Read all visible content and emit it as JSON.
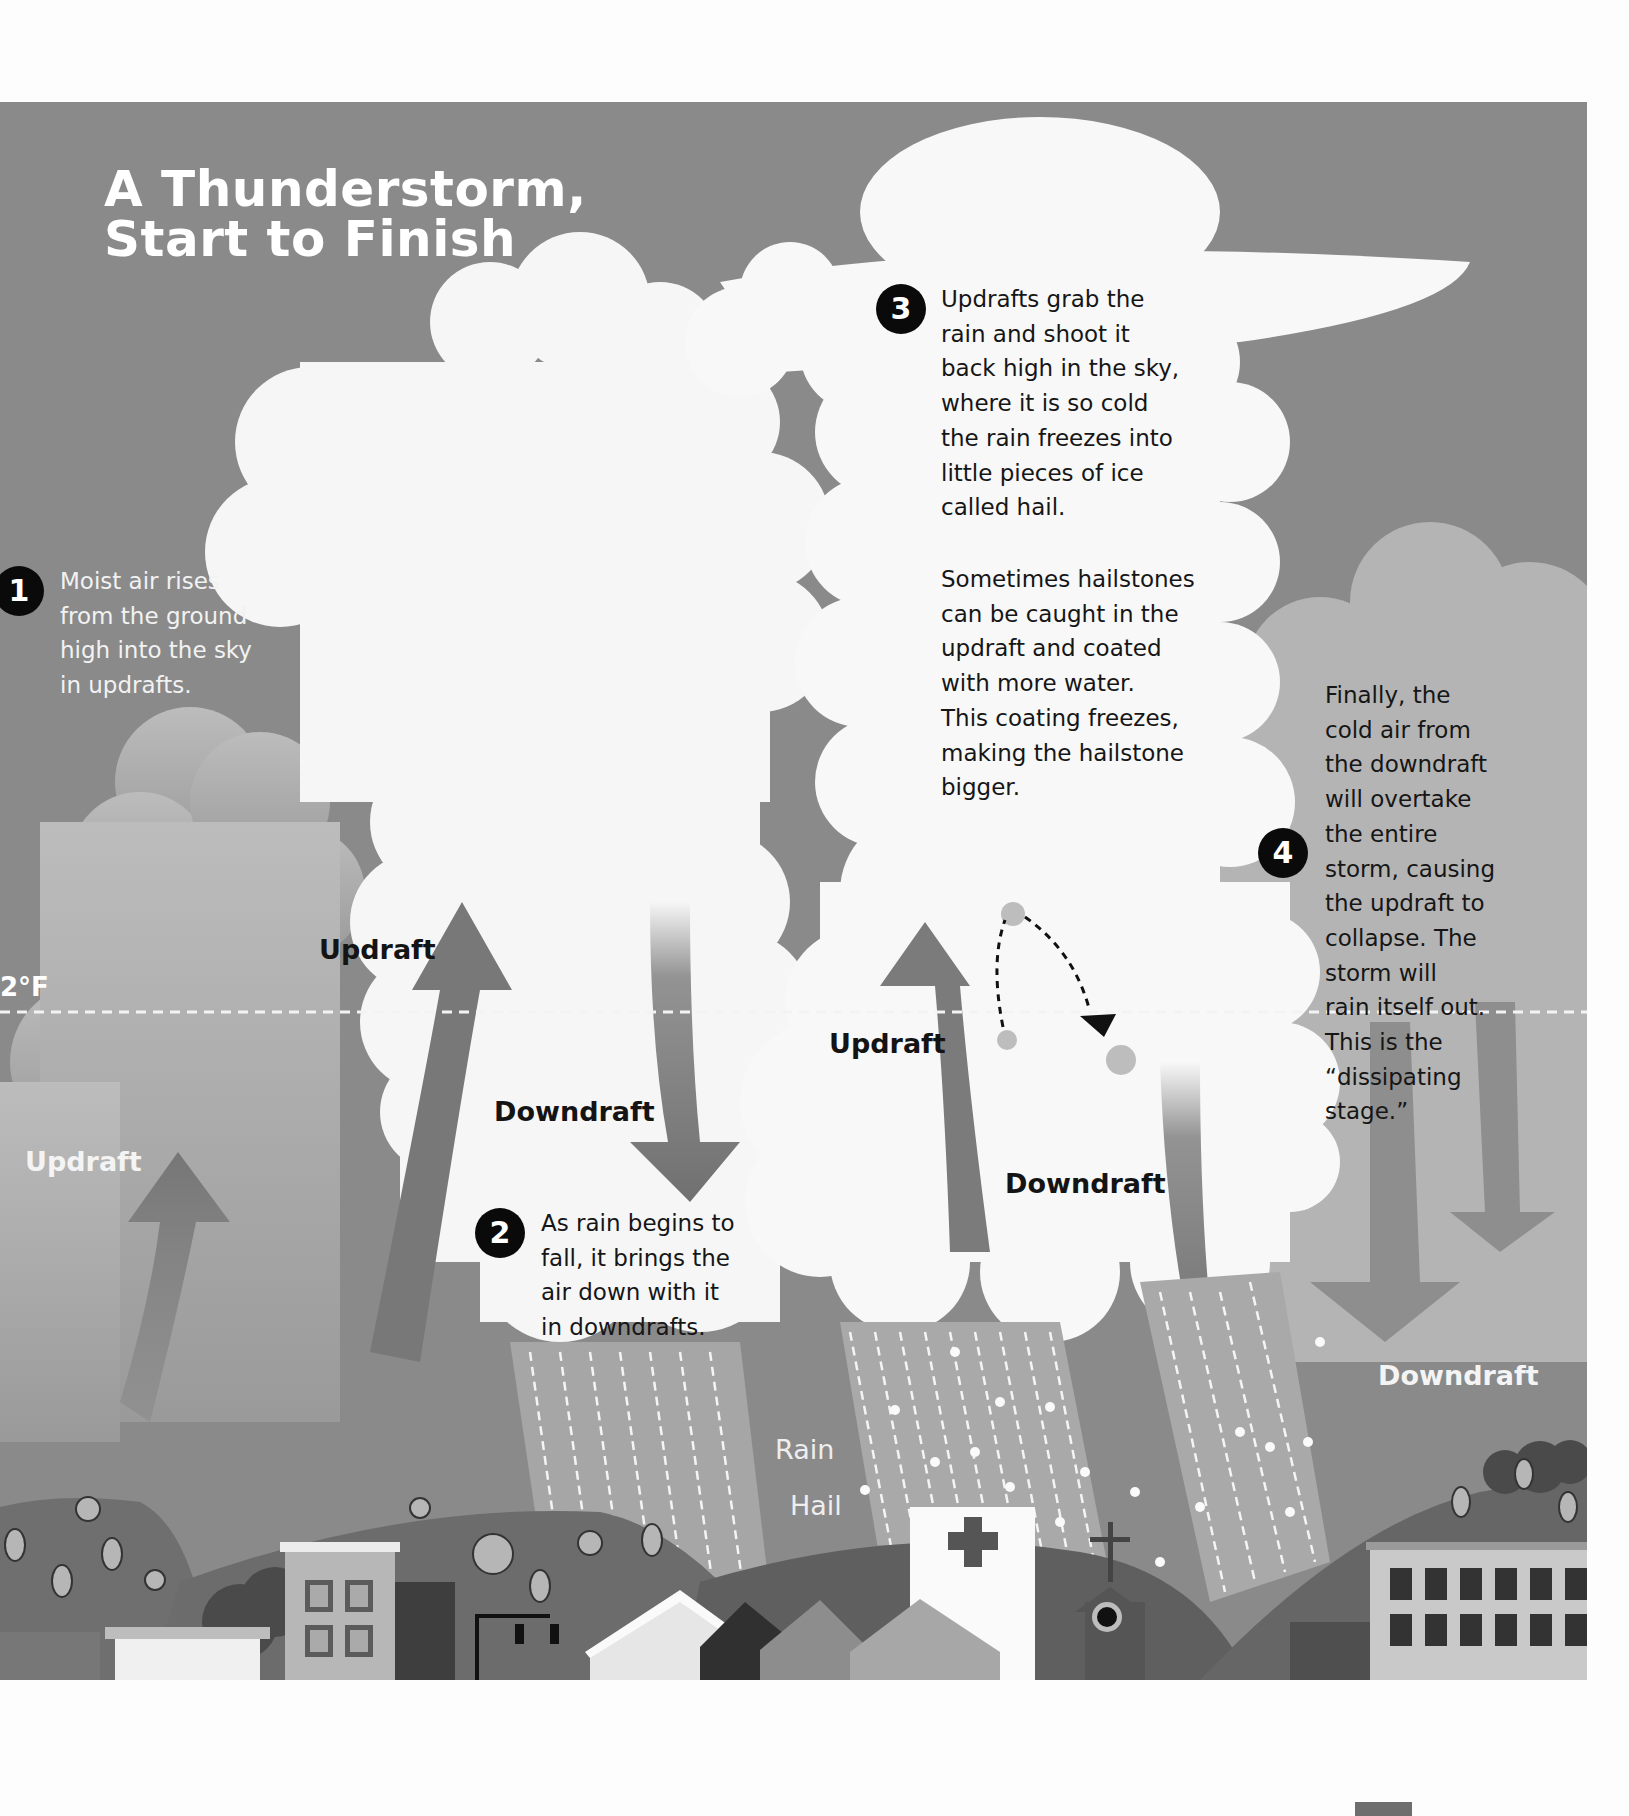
{
  "title": {
    "line1": "A Thunderstorm,",
    "line2": "Start to Finish"
  },
  "freezing_line": {
    "label": "2°F"
  },
  "steps": [
    {
      "number": "1",
      "lines": [
        "Moist air rises",
        "from the ground",
        "high into the sky",
        "in updrafts."
      ]
    },
    {
      "number": "2",
      "lines": [
        "As rain begins to",
        "fall, it brings the",
        "air down with it",
        "in downdrafts."
      ]
    },
    {
      "number": "3",
      "lines": [
        "Updrafts grab the",
        "rain and shoot it",
        "back high in the sky,",
        "where it is so cold",
        "the rain freezes into",
        "little pieces of ice",
        "called hail."
      ],
      "extra_lines": [
        "Sometimes hailstones",
        "can be caught in the",
        "updraft and coated",
        "with more water.",
        "This coating freezes,",
        "making the hailstone",
        "bigger."
      ]
    },
    {
      "number": "4",
      "lines": [
        "Finally, the",
        "cold air from",
        "the downdraft",
        "will overtake",
        "the entire",
        "storm, causing",
        "the updraft to",
        "collapse. The",
        "storm will",
        "rain itself out.",
        "This is the",
        "“dissipating",
        "stage.”"
      ]
    }
  ],
  "labels": {
    "updraft_stage1": "Updraft",
    "updraft_stage2": "Updraft",
    "downdraft_stage2": "Downdraft",
    "updraft_stage3": "Updraft",
    "downdraft_stage3": "Downdraft",
    "downdraft_stage4": "Downdraft",
    "rain": "Rain",
    "hail": "Hail"
  },
  "colors": {
    "sky": "#8a8a8a",
    "cloud": "#f7f7f7",
    "cloud_gray": "#b9b9b9",
    "arrow": "#7d7d7d",
    "hill": "#6d6d6d",
    "badge": "#0a0a0a"
  }
}
